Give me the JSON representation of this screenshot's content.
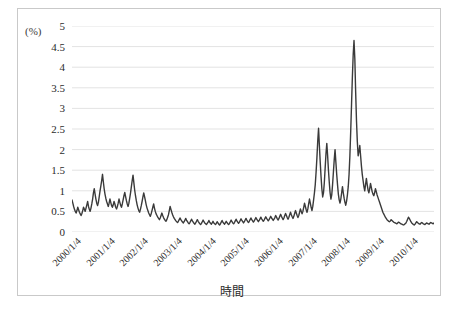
{
  "figure": {
    "unit_label": "(%)",
    "x_axis_title": "時間",
    "line_color": "#3a3a3a",
    "grid_color": "#e3e3e3",
    "frame_color": "#c9c9c9",
    "background": "#ffffff"
  },
  "chart_data": {
    "type": "line",
    "title": "",
    "subtitle": "",
    "xlabel": "時間",
    "ylabel": "(%)",
    "ylim": [
      0,
      5
    ],
    "y_ticks": [
      "0",
      "0.5",
      "1",
      "1.5",
      "2",
      "2.5",
      "3",
      "3.5",
      "4",
      "4.5",
      "5"
    ],
    "y_tick_values": [
      0,
      0.5,
      1,
      1.5,
      2,
      2.5,
      3,
      3.5,
      4,
      4.5,
      5
    ],
    "x_tick_labels": [
      "2000/1/4",
      "2001/1/4",
      "2002/1/4",
      "2003/1/4",
      "2004/1/4",
      "2005/1/4",
      "2006/1/4",
      "2007/1/4",
      "2008/1/4",
      "2009/1/4",
      "2010/1/4"
    ],
    "x_tick_positions": [
      0,
      1,
      2,
      3,
      4,
      5,
      6,
      7,
      8,
      9,
      10
    ],
    "xlim": [
      0,
      10.75
    ],
    "grid": "horizontal",
    "legend": "none",
    "series": [
      {
        "name": "spread",
        "color": "#3a3a3a",
        "x_start": 0,
        "x_end": 10.75,
        "values": [
          0.78,
          0.7,
          0.62,
          0.55,
          0.5,
          0.46,
          0.52,
          0.6,
          0.54,
          0.48,
          0.44,
          0.4,
          0.45,
          0.52,
          0.6,
          0.55,
          0.5,
          0.58,
          0.66,
          0.74,
          0.62,
          0.55,
          0.5,
          0.58,
          0.68,
          0.8,
          0.95,
          1.05,
          0.92,
          0.8,
          0.7,
          0.64,
          0.72,
          0.85,
          1.0,
          1.12,
          1.25,
          1.4,
          1.22,
          1.05,
          0.92,
          0.82,
          0.74,
          0.68,
          0.62,
          0.7,
          0.8,
          0.72,
          0.64,
          0.6,
          0.66,
          0.74,
          0.68,
          0.6,
          0.56,
          0.62,
          0.7,
          0.8,
          0.72,
          0.65,
          0.6,
          0.68,
          0.78,
          0.88,
          0.96,
          0.86,
          0.76,
          0.68,
          0.62,
          0.7,
          0.82,
          0.95,
          1.1,
          1.25,
          1.38,
          1.2,
          1.02,
          0.88,
          0.76,
          0.66,
          0.58,
          0.52,
          0.48,
          0.55,
          0.64,
          0.74,
          0.85,
          0.95,
          0.86,
          0.76,
          0.66,
          0.58,
          0.52,
          0.46,
          0.42,
          0.38,
          0.44,
          0.52,
          0.6,
          0.68,
          0.58,
          0.5,
          0.44,
          0.4,
          0.36,
          0.33,
          0.3,
          0.34,
          0.4,
          0.46,
          0.4,
          0.35,
          0.31,
          0.28,
          0.26,
          0.3,
          0.36,
          0.42,
          0.52,
          0.62,
          0.55,
          0.48,
          0.42,
          0.37,
          0.33,
          0.3,
          0.27,
          0.25,
          0.23,
          0.26,
          0.3,
          0.34,
          0.3,
          0.27,
          0.24,
          0.22,
          0.25,
          0.29,
          0.33,
          0.28,
          0.25,
          0.22,
          0.2,
          0.23,
          0.27,
          0.31,
          0.27,
          0.24,
          0.21,
          0.19,
          0.22,
          0.26,
          0.3,
          0.26,
          0.23,
          0.2,
          0.18,
          0.21,
          0.25,
          0.29,
          0.25,
          0.22,
          0.2,
          0.18,
          0.21,
          0.24,
          0.28,
          0.24,
          0.21,
          0.19,
          0.22,
          0.26,
          0.22,
          0.2,
          0.18,
          0.21,
          0.25,
          0.22,
          0.19,
          0.17,
          0.2,
          0.24,
          0.28,
          0.24,
          0.21,
          0.19,
          0.22,
          0.26,
          0.23,
          0.2,
          0.18,
          0.21,
          0.25,
          0.29,
          0.25,
          0.22,
          0.2,
          0.23,
          0.27,
          0.31,
          0.27,
          0.24,
          0.21,
          0.24,
          0.28,
          0.32,
          0.28,
          0.25,
          0.22,
          0.25,
          0.29,
          0.33,
          0.29,
          0.26,
          0.23,
          0.26,
          0.3,
          0.34,
          0.3,
          0.27,
          0.24,
          0.27,
          0.31,
          0.35,
          0.31,
          0.28,
          0.25,
          0.28,
          0.32,
          0.36,
          0.32,
          0.29,
          0.26,
          0.29,
          0.33,
          0.37,
          0.33,
          0.3,
          0.27,
          0.3,
          0.34,
          0.38,
          0.34,
          0.31,
          0.28,
          0.31,
          0.35,
          0.4,
          0.36,
          0.32,
          0.29,
          0.33,
          0.38,
          0.43,
          0.38,
          0.34,
          0.3,
          0.34,
          0.4,
          0.45,
          0.4,
          0.35,
          0.31,
          0.36,
          0.42,
          0.48,
          0.42,
          0.37,
          0.33,
          0.38,
          0.45,
          0.52,
          0.46,
          0.4,
          0.35,
          0.4,
          0.48,
          0.56,
          0.5,
          0.44,
          0.5,
          0.6,
          0.7,
          0.62,
          0.54,
          0.48,
          0.56,
          0.68,
          0.8,
          0.7,
          0.6,
          0.52,
          0.62,
          0.78,
          0.95,
          1.15,
          1.45,
          1.8,
          2.2,
          2.52,
          2.1,
          1.7,
          1.35,
          1.05,
          0.85,
          0.95,
          1.2,
          1.55,
          1.9,
          2.15,
          1.85,
          1.5,
          1.2,
          0.95,
          0.8,
          0.9,
          1.15,
          1.45,
          1.75,
          2.0,
          1.7,
          1.4,
          1.15,
          0.92,
          0.78,
          0.7,
          0.8,
          0.95,
          1.1,
          0.95,
          0.82,
          0.72,
          0.65,
          0.75,
          0.9,
          1.1,
          1.4,
          1.85,
          2.45,
          3.1,
          3.75,
          4.3,
          4.65,
          4.2,
          3.4,
          2.7,
          2.2,
          1.85,
          1.95,
          2.1,
          1.85,
          1.6,
          1.4,
          1.25,
          1.1,
          1.0,
          1.15,
          1.3,
          1.15,
          1.02,
          0.95,
          1.05,
          1.18,
          1.08,
          0.98,
          0.92,
          0.88,
          0.95,
          1.05,
          0.98,
          0.9,
          0.84,
          0.78,
          0.72,
          0.66,
          0.6,
          0.54,
          0.48,
          0.44,
          0.4,
          0.36,
          0.33,
          0.3,
          0.28,
          0.26,
          0.25,
          0.27,
          0.3,
          0.28,
          0.26,
          0.24,
          0.23,
          0.22,
          0.21,
          0.2,
          0.22,
          0.24,
          0.23,
          0.21,
          0.2,
          0.19,
          0.18,
          0.17,
          0.18,
          0.2,
          0.22,
          0.26,
          0.31,
          0.36,
          0.33,
          0.29,
          0.25,
          0.22,
          0.2,
          0.18,
          0.17,
          0.19,
          0.22,
          0.25,
          0.23,
          0.21,
          0.2,
          0.19,
          0.21,
          0.23,
          0.22,
          0.2,
          0.19,
          0.18,
          0.2,
          0.22,
          0.21,
          0.2,
          0.19,
          0.21,
          0.23,
          0.22,
          0.21,
          0.2,
          0.22
        ]
      }
    ]
  }
}
